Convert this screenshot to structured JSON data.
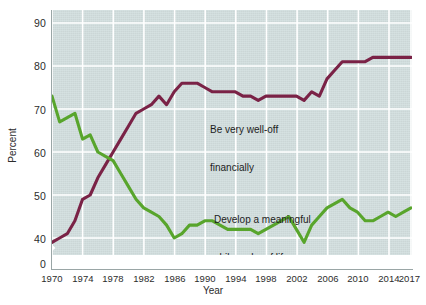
{
  "chart_data": {
    "type": "line",
    "title": "",
    "xlabel": "Year",
    "ylabel": "Percent",
    "xlim": [
      1970,
      2017
    ],
    "ylim": [
      35,
      92
    ],
    "grid": true,
    "legend_position": "inline-annotation",
    "axis_break": "y-axis broken between 0 and 40",
    "y_ticks": [
      "0",
      "40",
      "50",
      "60",
      "70",
      "80",
      "90"
    ],
    "x_ticks": [
      "1970",
      "1974",
      "1978",
      "1982",
      "1986",
      "1990",
      "1994",
      "1998",
      "2002",
      "2006",
      "2010",
      "2014",
      "2017"
    ],
    "x": [
      1970,
      1971,
      1972,
      1973,
      1974,
      1975,
      1976,
      1977,
      1978,
      1979,
      1980,
      1981,
      1982,
      1983,
      1984,
      1985,
      1986,
      1987,
      1988,
      1989,
      1990,
      1991,
      1992,
      1993,
      1994,
      1995,
      1996,
      1997,
      1998,
      1999,
      2000,
      2001,
      2002,
      2003,
      2004,
      2005,
      2006,
      2007,
      2008,
      2009,
      2010,
      2011,
      2012,
      2013,
      2014,
      2015,
      2016,
      2017
    ],
    "series": [
      {
        "name": "Be very well-off financially",
        "color": "#7a2246",
        "values": [
          39,
          40,
          41,
          44,
          49,
          50,
          54,
          57,
          60,
          63,
          66,
          69,
          70,
          71,
          73,
          71,
          74,
          76,
          76,
          76,
          75,
          74,
          74,
          74,
          74,
          73,
          73,
          72,
          73,
          73,
          73,
          73,
          73,
          72,
          74,
          73,
          77,
          79,
          81,
          81,
          81,
          81,
          82,
          82,
          82,
          82,
          82,
          82
        ]
      },
      {
        "name": "Develop a meaningful philosophy of life",
        "color": "#58a52c",
        "values": [
          73,
          67,
          68,
          69,
          63,
          64,
          60,
          59,
          58,
          55,
          52,
          49,
          47,
          46,
          45,
          43,
          40,
          41,
          43,
          43,
          44,
          44,
          43,
          42,
          42,
          42,
          42,
          41,
          42,
          43,
          44,
          45,
          42,
          39,
          43,
          45,
          47,
          48,
          49,
          47,
          46,
          44,
          44,
          45,
          46,
          45,
          46,
          47
        ]
      }
    ],
    "annotations": [
      {
        "id": "wealth",
        "line1": "Be very well-off",
        "line2": "financially"
      },
      {
        "id": "philosophy",
        "line1": "Develop a meaningful",
        "line2": "philosophy of life"
      }
    ]
  }
}
